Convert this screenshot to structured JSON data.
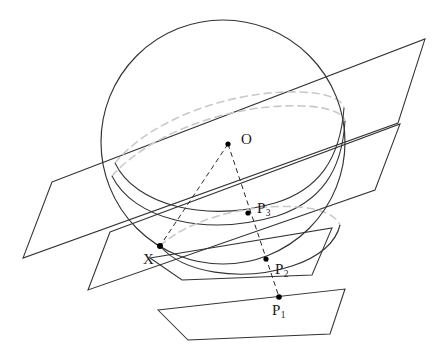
{
  "figure": {
    "background_color": "#ffffff",
    "stroke_color": "#2b2b2b",
    "hidden_stroke_color": "#c9c9c9",
    "point_color": "#000000",
    "width": 445,
    "height": 359
  },
  "sphere": {
    "name": "sphere",
    "cx": 223,
    "cy": 142,
    "r": 122,
    "stroke": "#333333",
    "stroke_width": 1.1
  },
  "points": [
    {
      "id": "O",
      "label": "O",
      "sub": "",
      "x": 228,
      "y": 144,
      "label_x": 241,
      "label_y": 132,
      "r": 2.6
    },
    {
      "id": "P3",
      "label": "P",
      "sub": "3",
      "x": 248,
      "y": 213,
      "label_x": 257,
      "label_y": 201,
      "r": 2.6
    },
    {
      "id": "X",
      "label": "X",
      "sub": "",
      "x": 160,
      "y": 246,
      "label_x": 146,
      "label_y": 253,
      "r": 3.0
    },
    {
      "id": "P2",
      "label": "P",
      "sub": "2",
      "x": 266,
      "y": 259,
      "label_x": 275,
      "label_y": 262,
      "r": 2.6
    },
    {
      "id": "P1",
      "label": "P",
      "sub": "1",
      "x": 279,
      "y": 297,
      "label_x": 274,
      "label_y": 303,
      "r": 2.8
    }
  ],
  "planes": [
    {
      "name": "plane-1-top",
      "points": "52,182 425,39 398,123 23,258",
      "stroke": "#333333"
    },
    {
      "name": "plane-2",
      "points": "110,232 400,124 375,190 88,290",
      "stroke": "#333333"
    },
    {
      "name": "plane-3",
      "points": "150,258 332,228 312,275 182,280",
      "stroke": "#333333"
    },
    {
      "name": "plane-4-bottom",
      "points": "158,310 345,289 330,334 188,340",
      "stroke": "#333333"
    }
  ],
  "rays": [
    {
      "name": "ray-O-to-P1",
      "from": "O",
      "to": "P1",
      "style": "dashed"
    },
    {
      "name": "ray-O-to-X",
      "from": "O",
      "to": "X",
      "style": "dashed"
    }
  ],
  "labels": {
    "center_point": "O",
    "tangency_point": "X",
    "projected_point_1": "P",
    "projected_point_1_sub": "1",
    "projected_point_2": "P",
    "projected_point_2_sub": "2",
    "projected_point_3": "P",
    "projected_point_3_sub": "3"
  }
}
